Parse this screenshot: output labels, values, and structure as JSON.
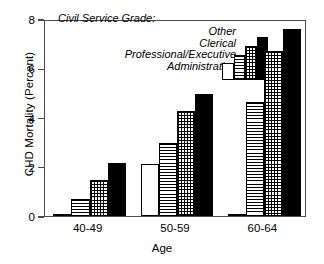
{
  "chart_data": {
    "type": "bar",
    "title": "",
    "xlabel": "Age",
    "ylabel": "CHD Mortality (Percent)",
    "categories": [
      "40-49",
      "50-59",
      "60-64"
    ],
    "ylim": [
      0,
      8
    ],
    "yticks": [
      0,
      2,
      4,
      6,
      8
    ],
    "grid": false,
    "legend_title": "Civil Service Grade:",
    "legend_position": "upper-left-inside",
    "series": [
      {
        "name": "Administrative",
        "pattern": "solid-white",
        "values": [
          0.05,
          2.1,
          0.07
        ]
      },
      {
        "name": "Professional/Executive",
        "pattern": "hlines",
        "values": [
          0.7,
          2.95,
          4.65
        ]
      },
      {
        "name": "Clerical",
        "pattern": "grid",
        "values": [
          1.45,
          4.25,
          6.7
        ]
      },
      {
        "name": "Other",
        "pattern": "black",
        "values": [
          2.15,
          4.95,
          7.6
        ]
      }
    ]
  },
  "legend": {
    "title": "Civil Service Grade:",
    "labels": [
      "Other",
      "Clerical",
      "Professional/Executive",
      "Administrative"
    ],
    "swatch_heights": [
      43,
      34,
      25,
      17
    ]
  },
  "axes": {
    "y_title": "CHD Mortality (Percent)",
    "x_title": "Age",
    "y_tick_labels": [
      "8",
      "6",
      "4",
      "2",
      "0"
    ],
    "x_tick_labels": [
      "40-49",
      "50-59",
      "60-64"
    ]
  },
  "colors": {
    "ink": "#000000",
    "frame": "#4a4a4a",
    "background": "#ffffff"
  }
}
